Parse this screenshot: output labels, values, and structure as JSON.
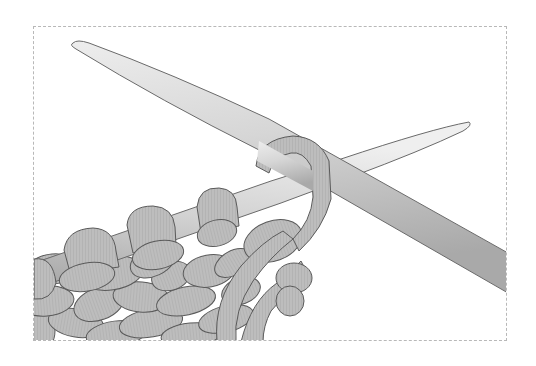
{
  "figure": {
    "alt": "Illustration of two crossed knitting needles with grey yarn loops and a knitted fabric",
    "frame": {
      "border_color": "#b8b8b8",
      "style": "dashed"
    },
    "colors": {
      "needle_light": "#e4e4e4",
      "needle_mid": "#c8c8c8",
      "needle_dark": "#9a9a9a",
      "yarn_fill": "#bdbdbd",
      "outline": "#5a5a5a",
      "background": "#ffffff"
    },
    "elements": {
      "left_needle": "Needle running from lower-left to upper-right tip, holding a row of loops",
      "right_needle": "Needle running from upper-left tip to lower-right edge, crossing left needle",
      "working_yarn": "Yarn loop wrapped around the crossing point",
      "fabric": "Rows of knitted stitches below the left needle"
    }
  }
}
